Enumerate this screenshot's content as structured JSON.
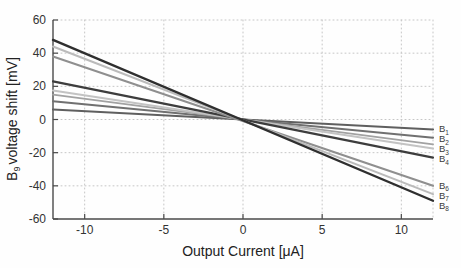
{
  "axes": {
    "x_label": "Output Current [μA]",
    "y_label_base": "B",
    "y_label_sub": "9",
    "y_label_rest": "voltage shift [mV]"
  },
  "colors": {
    "background": "#fefefe",
    "grid": "#c6c6c6",
    "axis": "#4a4a4a",
    "tick_text": "#333333",
    "series_label_text": "#3a3a3a"
  },
  "chart_data": {
    "type": "line",
    "title": "",
    "xlabel": "Output Current [μA]",
    "ylabel": "B9 voltage shift [mV]",
    "xlim": [
      -12,
      12
    ],
    "ylim": [
      -60,
      60
    ],
    "x_ticks": [
      -10,
      -5,
      0,
      5,
      10
    ],
    "y_ticks": [
      -60,
      -40,
      -20,
      0,
      20,
      40,
      60
    ],
    "grid": "dotted",
    "grid_x": [
      -10,
      -5,
      0,
      5,
      10,
      12
    ],
    "grid_y": [
      -40,
      -20,
      0,
      20,
      40,
      60
    ],
    "legend_position": "right-edge-labels",
    "series": [
      {
        "name": "B1",
        "label_base": "B",
        "label_sub": "1",
        "x": [
          -12,
          12
        ],
        "y": [
          6,
          -6
        ],
        "color": "#5f5f5f",
        "width": 2.1
      },
      {
        "name": "B2",
        "label_base": "B",
        "label_sub": "2",
        "x": [
          -12,
          12
        ],
        "y": [
          11,
          -11
        ],
        "color": "#707070",
        "width": 2.1
      },
      {
        "name": "",
        "label_base": "",
        "label_sub": null,
        "x": [
          -12,
          12
        ],
        "y": [
          15,
          -15
        ],
        "color": "#a2a2a2",
        "width": 1.8
      },
      {
        "name": "B3",
        "label_base": "B",
        "label_sub": "3",
        "x": [
          -12,
          12
        ],
        "y": [
          17.5,
          -17.5
        ],
        "color": "#c3c3c3",
        "width": 2.1
      },
      {
        "name": "B4",
        "label_base": "B",
        "label_sub": "4",
        "x": [
          -12,
          12
        ],
        "y": [
          23,
          -23
        ],
        "color": "#3d3d3d",
        "width": 2.2
      },
      {
        "name": "B6",
        "label_base": "B",
        "label_sub": "6",
        "x": [
          -12,
          12
        ],
        "y": [
          38,
          -40
        ],
        "color": "#8f8f8f",
        "width": 2.1
      },
      {
        "name": "B7",
        "label_base": "B",
        "label_sub": "7",
        "x": [
          -12,
          12
        ],
        "y": [
          44,
          -45
        ],
        "color": "#bbbbbb",
        "width": 2.1
      },
      {
        "name": "B8",
        "label_base": "B",
        "label_sub": "8",
        "x": [
          -12,
          12
        ],
        "y": [
          48,
          -49
        ],
        "color": "#2f2f2f",
        "width": 2.4
      }
    ]
  }
}
